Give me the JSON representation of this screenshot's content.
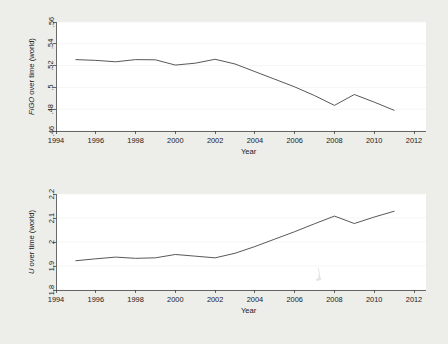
{
  "figure": {
    "background_color": "#ededea",
    "plot_background_color": "#ffffff",
    "line_color": "#3a3a3a"
  },
  "chart_data": [
    {
      "type": "line",
      "panel": "top",
      "title": "",
      "xlabel": "Year",
      "ylabel": "FiGO over time (world)",
      "xlim": [
        1994,
        2012
      ],
      "ylim": [
        0.46,
        0.56
      ],
      "xticks": [
        1994,
        1996,
        1998,
        2000,
        2002,
        2004,
        2006,
        2008,
        2010,
        2012
      ],
      "xtick_labels": [
        "1994",
        "1996",
        "1998",
        "2000",
        "2002",
        "2004",
        "2006",
        "2008",
        "2010",
        "2012"
      ],
      "yticks": [
        0.46,
        0.48,
        0.5,
        0.52,
        0.54,
        0.56
      ],
      "ytick_labels": [
        ".46",
        ".48",
        ".5",
        ".52",
        ".54",
        ".56"
      ],
      "grid": true,
      "legend": null,
      "x": [
        1995,
        1996,
        1997,
        1998,
        1999,
        2000,
        2001,
        2002,
        2003,
        2004,
        2005,
        2006,
        2007,
        2008,
        2009,
        2010,
        2011
      ],
      "values": [
        0.5255,
        0.5248,
        0.5235,
        0.5255,
        0.5253,
        0.5205,
        0.5222,
        0.5258,
        0.5215,
        0.5145,
        0.5075,
        0.5005,
        0.4925,
        0.4835,
        0.4935,
        0.4865,
        0.479
      ]
    },
    {
      "type": "line",
      "panel": "bottom",
      "title": "",
      "xlabel": "Year",
      "ylabel": "U over time (world)",
      "xlim": [
        1994,
        2012
      ],
      "ylim": [
        1.8,
        2.2
      ],
      "xticks": [
        1994,
        1996,
        1998,
        2000,
        2002,
        2004,
        2006,
        2008,
        2010,
        2012
      ],
      "xtick_labels": [
        "1994",
        "1996",
        "1998",
        "2000",
        "2002",
        "2004",
        "2006",
        "2008",
        "2010",
        "2012"
      ],
      "yticks": [
        1.8,
        1.9,
        2.0,
        2.1,
        2.2
      ],
      "ytick_labels": [
        "1.8",
        "1.9",
        "2",
        "2.1",
        "2.2"
      ],
      "grid": true,
      "legend": null,
      "x": [
        1995,
        1996,
        1997,
        1998,
        1999,
        2000,
        2001,
        2002,
        2003,
        2004,
        2005,
        2006,
        2007,
        2008,
        2009,
        2010,
        2011
      ],
      "values": [
        1.922,
        1.93,
        1.937,
        1.932,
        1.934,
        1.948,
        1.941,
        1.934,
        1.953,
        1.981,
        2.012,
        2.043,
        2.076,
        2.108,
        2.077,
        2.104,
        2.128
      ]
    }
  ],
  "top_chart": {
    "ylabel": "FiGO over time (world)",
    "ylabel_italic_part": "FiGO",
    "ylabel_roman_part": " over time (world)",
    "xlabel": "Year",
    "ytick_labels": [
      ".46",
      ".48",
      ".5",
      ".52",
      ".54",
      ".56"
    ],
    "xtick_labels": [
      "1994",
      "1996",
      "1998",
      "2000",
      "2002",
      "2004",
      "2006",
      "2008",
      "2010",
      "2012"
    ]
  },
  "bottom_chart": {
    "ylabel": "U over time (world)",
    "ylabel_italic_part": "U",
    "ylabel_roman_part": " over time (world)",
    "xlabel": "Year",
    "ytick_labels": [
      "1.8",
      "1.9",
      "2",
      "2.1",
      "2.2"
    ],
    "xtick_labels": [
      "1994",
      "1996",
      "1998",
      "2000",
      "2002",
      "2004",
      "2006",
      "2008",
      "2010",
      "2012"
    ]
  }
}
